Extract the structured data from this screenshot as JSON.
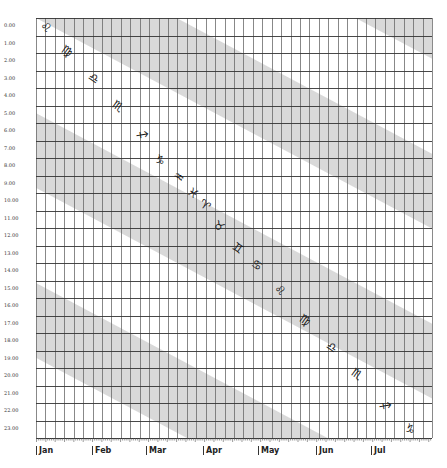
{
  "chart_data": {
    "type": "heatmap",
    "title": "",
    "ylabel": "Hour",
    "xlabel": "Month",
    "y_ticks": [
      "0.00",
      "1.00",
      "2.00",
      "3.00",
      "4.00",
      "5.00",
      "6.00",
      "7.00",
      "8.00",
      "9.00",
      "10.00",
      "11.00",
      "12.00",
      "13.00",
      "14.00",
      "15.00",
      "16.00",
      "17.00",
      "18.00",
      "19.00",
      "20.00",
      "21.00",
      "22.00",
      "23.00"
    ],
    "x_months": [
      "Jan",
      "Feb",
      "Mar",
      "Apr",
      "May",
      "Jun",
      "Jul"
    ],
    "x_minor_ticks": [
      "5",
      "10",
      "15",
      "20",
      "25",
      "30"
    ],
    "grid": true,
    "columns": 42,
    "rows": 24,
    "band_color": "#d9d9d9",
    "grid_color": "#555555",
    "zodiac_sequence": [
      {
        "symbol": "♌",
        "name": "Leo",
        "x": 46,
        "y": 27
      },
      {
        "symbol": "♍",
        "name": "Virgo",
        "x": 67,
        "y": 51
      },
      {
        "symbol": "♎",
        "name": "Libra",
        "x": 94,
        "y": 78
      },
      {
        "symbol": "♏",
        "name": "Scorpio",
        "x": 118,
        "y": 106
      },
      {
        "symbol": "♐",
        "name": "Sagittarius",
        "x": 142,
        "y": 135
      },
      {
        "symbol": "♑",
        "name": "Capricorn",
        "x": 160,
        "y": 160
      },
      {
        "symbol": "♒",
        "name": "Aquarius",
        "x": 179,
        "y": 177
      },
      {
        "symbol": "♓",
        "name": "Pisces",
        "x": 193,
        "y": 193
      },
      {
        "symbol": "♈",
        "name": "Aries",
        "x": 205,
        "y": 205
      },
      {
        "symbol": "♉",
        "name": "Taurus",
        "x": 219,
        "y": 226
      },
      {
        "symbol": "♊",
        "name": "Gemini",
        "x": 238,
        "y": 248
      },
      {
        "symbol": "♋",
        "name": "Cancer",
        "x": 257,
        "y": 265
      },
      {
        "symbol": "♌",
        "name": "Leo",
        "x": 280,
        "y": 290
      },
      {
        "symbol": "♍",
        "name": "Virgo",
        "x": 305,
        "y": 320
      },
      {
        "symbol": "♎",
        "name": "Libra",
        "x": 332,
        "y": 347
      },
      {
        "symbol": "♏",
        "name": "Scorpio",
        "x": 357,
        "y": 374
      },
      {
        "symbol": "♐",
        "name": "Sagittarius",
        "x": 385,
        "y": 406
      },
      {
        "symbol": "♑",
        "name": "Capricorn",
        "x": 410,
        "y": 429
      }
    ]
  }
}
